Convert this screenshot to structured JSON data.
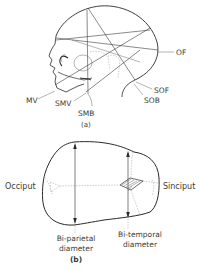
{
  "figure_a": {
    "caption": "(a)",
    "labels": {
      "of": "OF",
      "sof": "SOF",
      "sob": "SOB",
      "mv": "MV",
      "smv": "SMV",
      "smb": "SMB"
    },
    "description": "Lateral view of fetal skull showing presenting diameters"
  },
  "figure_b": {
    "caption": "(b)",
    "labels": {
      "occiput": "Occiput",
      "sinciput": "Sinciput",
      "biparietal_line1": "Bi-parietal",
      "biparietal_line2": "diameter",
      "bitemporal_line1": "Bi-temporal",
      "bitemporal_line2": "diameter"
    },
    "description": "Superior view of fetal skull showing transverse diameters"
  },
  "colors": {
    "line": "#2a2a2a",
    "text": "#3a3a3a",
    "background": "#ffffff"
  }
}
